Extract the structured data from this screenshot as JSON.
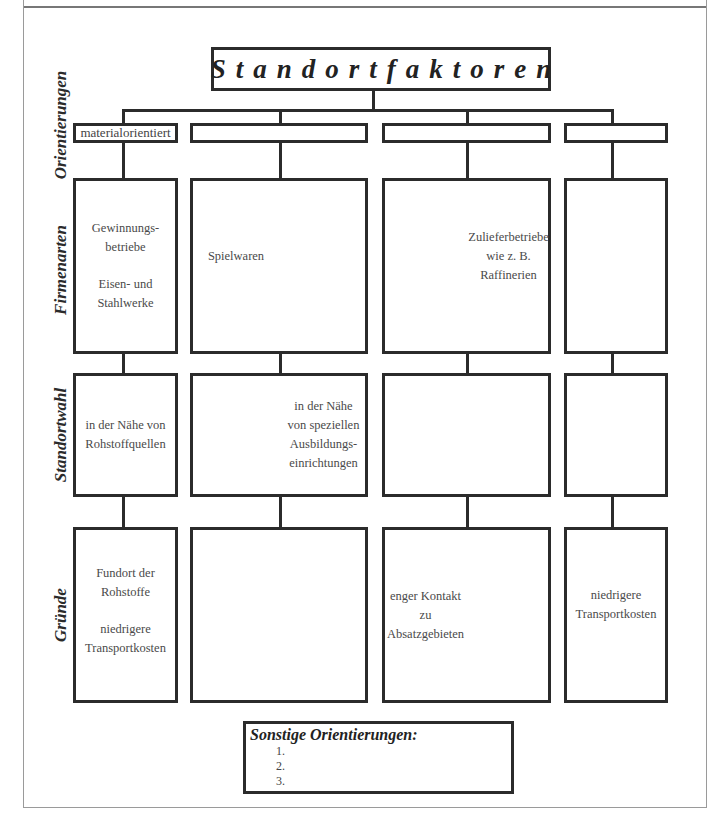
{
  "diagram": {
    "title": "Standortfaktoren",
    "row_labels": {
      "orientierungen": "Orientierungen",
      "firmenarten": "Firmenarten",
      "standortwahl": "Standortwahl",
      "gruende": "Gründe"
    },
    "columns": [
      {
        "orientation": "materialorientiert",
        "firmenarten": [
          "Gewinnungs-",
          "betriebe",
          "",
          "Eisen- und",
          "Stahlwerke"
        ],
        "standortwahl": [
          "in der Nähe von",
          "Rohstoffquellen"
        ],
        "gruende": [
          "Fundort der",
          "Rohstoffe",
          "",
          "niedrigere",
          "Transportkosten"
        ]
      },
      {
        "orientation": "",
        "firmenarten_left": [
          "Spielwaren"
        ],
        "firmenarten_right": [],
        "standortwahl_left": [],
        "standortwahl_right": [
          "in der Nähe",
          "von speziellen",
          "Ausbildungs-",
          "einrichtungen"
        ],
        "gruende_left": [],
        "gruende_right": []
      },
      {
        "orientation": "",
        "firmenarten_left": [],
        "firmenarten_right": [
          "Zulieferbetriebe",
          "wie z. B.",
          "Raffinerien"
        ],
        "standortwahl_left": [],
        "standortwahl_right": [],
        "gruende_left": [
          "enger Kontakt",
          "zu",
          "Absatzgebieten"
        ],
        "gruende_right": []
      },
      {
        "orientation": "",
        "firmenarten": [],
        "standortwahl": [],
        "gruende": [
          "niedrigere",
          "Transportkosten"
        ]
      }
    ],
    "sonstige": {
      "title": "Sonstige Orientierungen:",
      "items": [
        "1.",
        "2.",
        "3."
      ]
    }
  }
}
